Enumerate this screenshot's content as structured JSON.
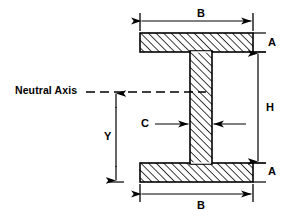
{
  "diagram": {
    "stroke_color": "#000000",
    "fill_color": "#ffffff",
    "background_color": "#ffffff",
    "hatch_angle_deg": 45,
    "labels": {
      "neutral_axis": "Neutral Axis",
      "width_top": "B",
      "width_bottom": "B",
      "flange_thickness_top": "A",
      "flange_thickness_bottom": "A",
      "web_height": "H",
      "web_thickness": "C",
      "centroid_distance": "Y"
    },
    "geometry": {
      "flange_left_x": 140,
      "flange_right_x": 253,
      "top_flange_top_y": 33,
      "top_flange_bottom_y": 52,
      "bottom_flange_top_y": 163,
      "bottom_flange_bottom_y": 182,
      "web_left_x": 190,
      "web_right_x": 212,
      "neutral_axis_y": 92
    },
    "dimension_lines": [
      {
        "name": "B-top",
        "orientation": "horizontal",
        "y": 20,
        "from_x": 140,
        "to_x": 253,
        "label": "B"
      },
      {
        "name": "B-bottom",
        "orientation": "horizontal",
        "y": 196,
        "from_x": 140,
        "to_x": 253,
        "label": "B"
      },
      {
        "name": "H",
        "orientation": "vertical",
        "x": 258,
        "from_y": 52,
        "to_y": 163,
        "label": "H"
      },
      {
        "name": "Y",
        "orientation": "vertical",
        "x": 116,
        "from_y": 92,
        "to_y": 182,
        "label": "Y"
      },
      {
        "name": "C",
        "orientation": "horizontal-inward",
        "y": 124,
        "from_x": 155,
        "to_x": 238,
        "label": "C"
      },
      {
        "name": "A-top",
        "orientation": "tick",
        "x": 253,
        "from_y": 33,
        "to_y": 52,
        "label": "A"
      },
      {
        "name": "A-bottom",
        "orientation": "tick",
        "x": 253,
        "from_y": 163,
        "to_y": 182,
        "label": "A"
      }
    ]
  }
}
